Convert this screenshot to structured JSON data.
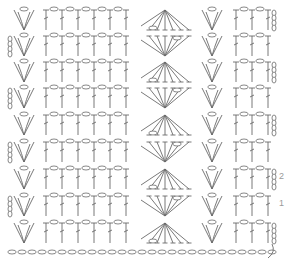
{
  "diagram": {
    "type": "crochet-stitch-chart",
    "stroke_color": "#6a6a6a",
    "label_color": "#9a9a9a",
    "row_labels": [
      {
        "label": "2",
        "y": 178
      },
      {
        "label": "1",
        "y": 205
      }
    ],
    "rows_y": [
      18,
      44,
      70,
      96,
      123,
      150,
      177,
      204,
      231
    ],
    "foundation_chain_y": 252,
    "pattern_repeat": {
      "v_stitch_x": [
        22,
        232
      ],
      "dc_x_left": [
        52,
        72,
        92,
        112
      ],
      "fan_center_x": 165,
      "fan_dc_count": 6,
      "dc_x_right": [
        256,
        276
      ]
    }
  }
}
